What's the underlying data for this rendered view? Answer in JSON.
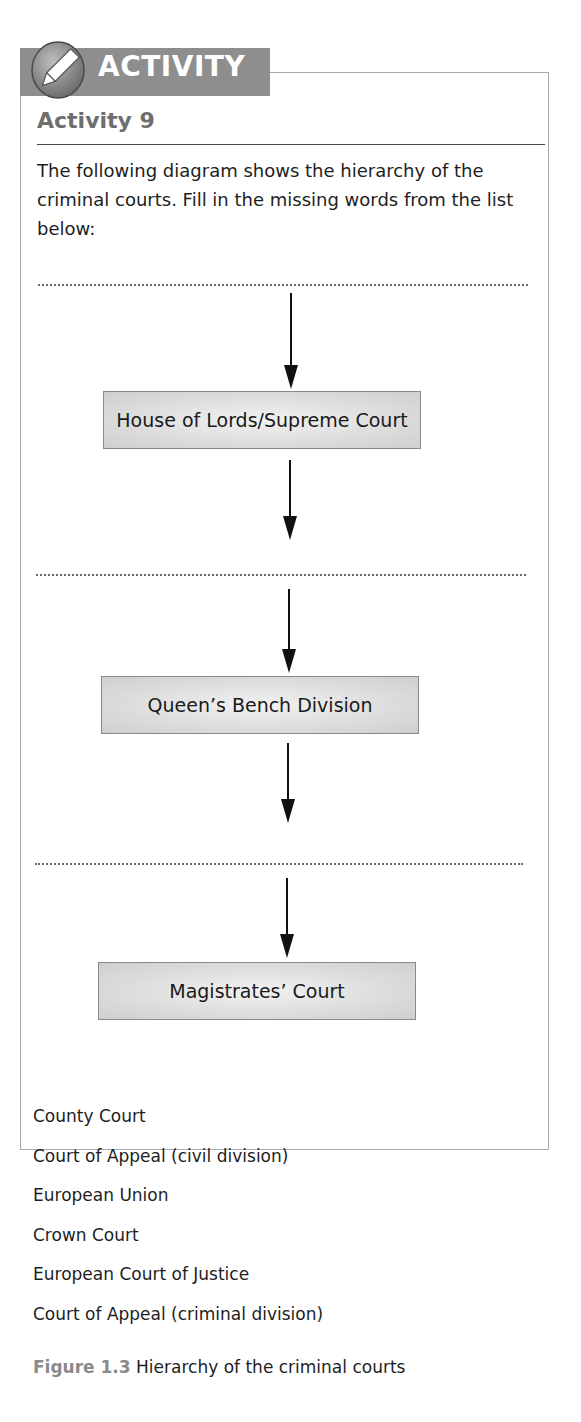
{
  "banner": {
    "label": "ACTIVITY",
    "icon": "pencil-icon",
    "color": "#8e8e8e"
  },
  "activity": {
    "title": "Activity 9",
    "instructions": "The following diagram shows the hierarchy of the criminal courts. Fill in the missing words from the list below:"
  },
  "diagram": {
    "levels": [
      {
        "type": "blank",
        "label": ""
      },
      {
        "type": "box",
        "label": "House of Lords/Supreme Court"
      },
      {
        "type": "blank",
        "label": ""
      },
      {
        "type": "box",
        "label": "Queen’s Bench Division"
      },
      {
        "type": "blank",
        "label": ""
      },
      {
        "type": "box",
        "label": "Magistrates’ Court"
      }
    ],
    "box_color": "#d6d6d6"
  },
  "word_list": [
    "County Court",
    "Court of Appeal (civil division)",
    "European Union",
    "Crown Court",
    "European Court of Justice",
    "Court of Appeal (criminal division)"
  ],
  "caption": {
    "figure_label": "Figure 1.3",
    "text": "Hierarchy of the criminal courts"
  }
}
